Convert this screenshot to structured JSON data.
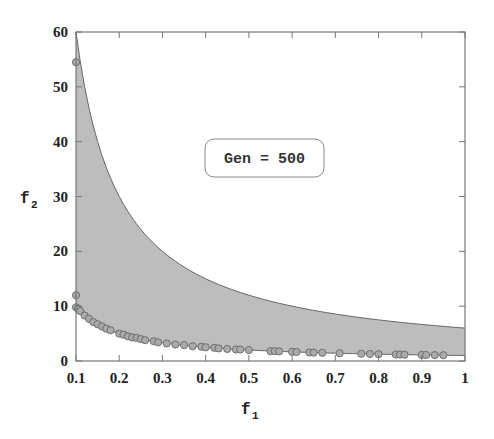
{
  "chart_data": {
    "type": "scatter",
    "title": "",
    "xlabel": "f1",
    "ylabel": "f2",
    "xlabel_main": "f",
    "xlabel_sub": "1",
    "ylabel_main": "f",
    "ylabel_sub": "2",
    "xlim": [
      0.1,
      1
    ],
    "ylim": [
      0,
      60
    ],
    "grid": false,
    "x_ticks": [
      "0.1",
      "0.2",
      "0.3",
      "0.4",
      "0.5",
      "0.6",
      "0.7",
      "0.8",
      "0.9",
      "1"
    ],
    "y_ticks": [
      "0",
      "10",
      "20",
      "30",
      "40",
      "50",
      "60"
    ],
    "annotation": "Gen = 500",
    "feasible_region": {
      "description": "shaded region between lower bound f2 = 1/f1 and upper bound f2 = 6/f1",
      "lower": {
        "x": [
          0.1,
          0.15,
          0.2,
          0.3,
          0.4,
          0.5,
          0.6,
          0.7,
          0.8,
          0.9,
          1.0
        ],
        "y": [
          10,
          6.67,
          5,
          3.33,
          2.5,
          2,
          1.67,
          1.43,
          1.25,
          1.11,
          1
        ]
      },
      "upper": {
        "x": [
          0.1,
          0.15,
          0.2,
          0.3,
          0.4,
          0.5,
          0.6,
          0.7,
          0.8,
          0.9,
          1.0
        ],
        "y": [
          60,
          40,
          30,
          20,
          15,
          12,
          10,
          8.57,
          7.5,
          6.67,
          6
        ]
      },
      "fill_color": "#bdbdbd"
    },
    "series": [
      {
        "name": "population",
        "marker": "circle",
        "color": "#aaaaaa",
        "x": [
          0.1,
          0.1,
          0.1,
          0.105,
          0.11,
          0.12,
          0.13,
          0.14,
          0.15,
          0.16,
          0.17,
          0.18,
          0.2,
          0.21,
          0.22,
          0.23,
          0.24,
          0.25,
          0.26,
          0.28,
          0.29,
          0.31,
          0.33,
          0.35,
          0.37,
          0.39,
          0.4,
          0.42,
          0.43,
          0.45,
          0.47,
          0.48,
          0.5,
          0.55,
          0.56,
          0.57,
          0.6,
          0.61,
          0.64,
          0.65,
          0.67,
          0.71,
          0.76,
          0.78,
          0.8,
          0.84,
          0.85,
          0.86,
          0.9,
          0.91,
          0.93,
          0.95
        ],
        "y": [
          54.5,
          12,
          9.8,
          9.5,
          9.1,
          8.3,
          7.7,
          7.1,
          6.7,
          6.3,
          5.9,
          5.6,
          5.0,
          4.8,
          4.5,
          4.3,
          4.2,
          4.0,
          3.8,
          3.6,
          3.4,
          3.2,
          3.0,
          2.9,
          2.7,
          2.6,
          2.5,
          2.4,
          2.3,
          2.2,
          2.1,
          2.1,
          2.0,
          1.8,
          1.8,
          1.75,
          1.67,
          1.64,
          1.56,
          1.54,
          1.5,
          1.41,
          1.32,
          1.28,
          1.25,
          1.19,
          1.18,
          1.16,
          1.11,
          1.1,
          1.08,
          1.05
        ]
      }
    ],
    "legend": null
  }
}
